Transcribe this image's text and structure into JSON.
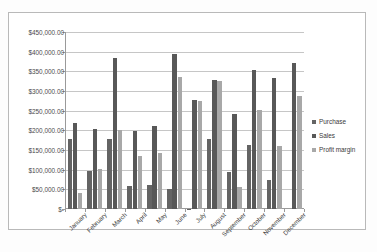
{
  "chart_data": {
    "type": "bar",
    "title": "",
    "subtitle": "",
    "xlabel": "",
    "ylabel": "",
    "ylim": [
      0,
      450000
    ],
    "ytick_step": 50000,
    "grid": true,
    "legend_position": "right",
    "categories": [
      "January",
      "February",
      "March",
      "April",
      "May",
      "June",
      "July",
      "August",
      "September",
      "October",
      "November",
      "December"
    ],
    "ytick_labels": [
      "$450,000.00",
      "$400,000.00",
      "$350,000.00",
      "$300,000.00",
      "$250,000.00",
      "$200,000.00",
      "$150,000.00",
      "$100,000.00",
      "$50,000.00",
      "$-"
    ],
    "ytick_values": [
      450000,
      400000,
      350000,
      300000,
      250000,
      200000,
      150000,
      100000,
      50000,
      0
    ],
    "series": [
      {
        "name": "Purchase",
        "color": "#646464",
        "values": [
          178000,
          97000,
          178000,
          58000,
          61000,
          50000,
          1000,
          178000,
          94000,
          164000,
          73000,
          0
        ]
      },
      {
        "name": "Sales",
        "color": "#585858",
        "values": [
          218000,
          203000,
          384000,
          198000,
          210000,
          395000,
          278000,
          329000,
          241000,
          354000,
          333000,
          371000
        ]
      },
      {
        "name": "Profit margin",
        "color": "#a8a8a8",
        "values": [
          40000,
          101000,
          202000,
          136000,
          142000,
          336000,
          274000,
          325000,
          56000,
          251000,
          159000,
          287000
        ]
      }
    ]
  },
  "legend": {
    "items": [
      {
        "label": "Purchase"
      },
      {
        "label": "Sales"
      },
      {
        "label": "Profit margin"
      }
    ]
  }
}
